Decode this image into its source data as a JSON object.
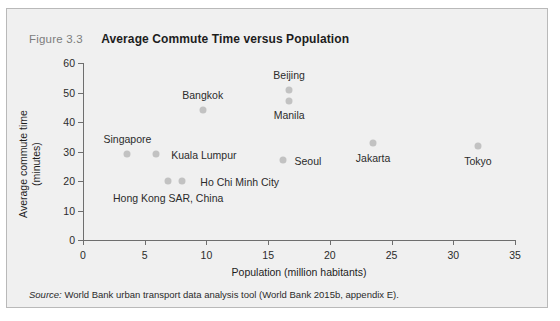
{
  "figure": {
    "number": "Figure 3.3",
    "title": "Average Commute Time versus Population",
    "source": "World Bank urban transport data analysis tool (World Bank 2015b, appendix E).",
    "source_word": "Source:",
    "panel_bg": "#f0f0f0",
    "marker_color": "#c2c2c2",
    "axis_color": "#6e6e6e"
  },
  "chart_data": {
    "type": "scatter",
    "title": "Average Commute Time versus Population",
    "xlabel": "Population (million habitants)",
    "ylabel": "Average commute time\n(minutes)",
    "xlim": [
      0,
      35
    ],
    "ylim": [
      0,
      60
    ],
    "xticks": [
      0,
      5,
      10,
      15,
      20,
      25,
      30,
      35
    ],
    "yticks": [
      0,
      10,
      20,
      30,
      40,
      50,
      60
    ],
    "grid": false,
    "legend": "none",
    "points": [
      {
        "label": "Singapore",
        "x": 3.6,
        "y": 29,
        "label_dx": 0,
        "label_dy": -15
      },
      {
        "label": "Kuala Lumpur",
        "x": 5.9,
        "y": 29,
        "label_dx": 48,
        "label_dy": 1
      },
      {
        "label": "Hong Kong SAR, China",
        "x": 6.9,
        "y": 20,
        "label_dx": 0,
        "label_dy": 17
      },
      {
        "label": "Ho Chi Minh City",
        "x": 8.0,
        "y": 20,
        "label_dx": 58,
        "label_dy": 1
      },
      {
        "label": "Bangkok",
        "x": 9.7,
        "y": 44,
        "label_dx": 0,
        "label_dy": -15
      },
      {
        "label": "Seoul",
        "x": 16.2,
        "y": 27,
        "label_dx": 25,
        "label_dy": 1
      },
      {
        "label": "Manila",
        "x": 16.7,
        "y": 47,
        "label_dx": 0,
        "label_dy": 14
      },
      {
        "label": "Beijing",
        "x": 16.7,
        "y": 51,
        "label_dx": 0,
        "label_dy": -15
      },
      {
        "label": "Jakarta",
        "x": 23.5,
        "y": 33,
        "label_dx": 0,
        "label_dy": 15
      },
      {
        "label": "Tokyo",
        "x": 32.0,
        "y": 32,
        "label_dx": 0,
        "label_dy": 15
      }
    ]
  }
}
